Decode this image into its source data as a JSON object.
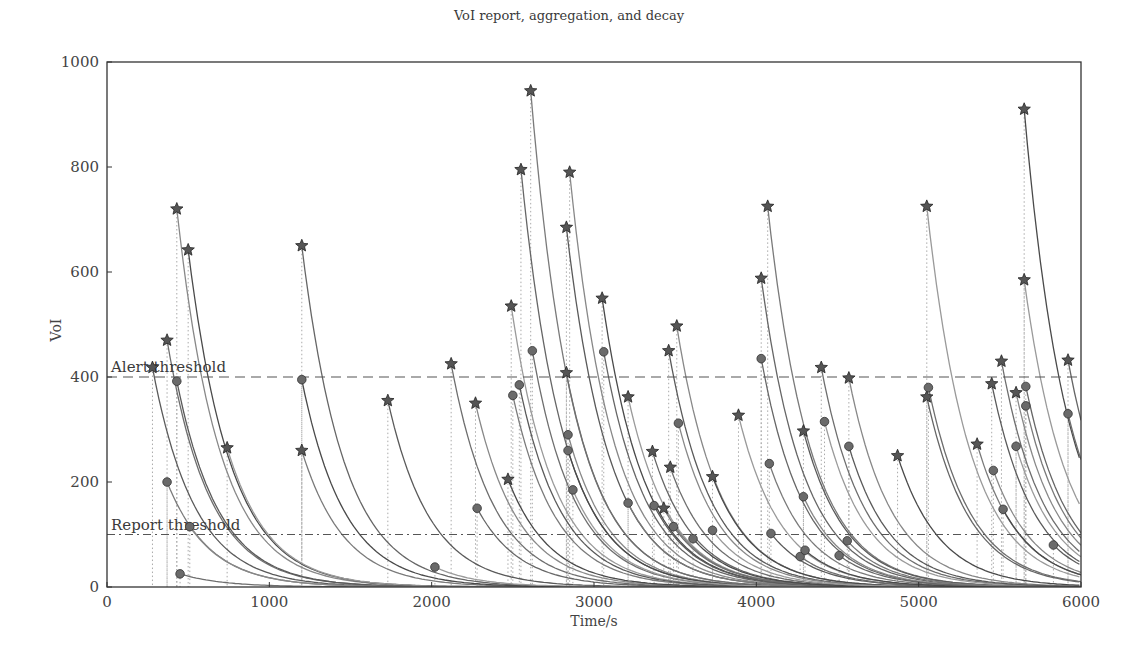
{
  "chart_data": {
    "type": "scatter",
    "title": "VoI report, aggregation, and decay",
    "xlabel": "Time/s",
    "ylabel": "VoI",
    "xlim": [
      0,
      6000
    ],
    "ylim": [
      0,
      1000
    ],
    "xticks": [
      0,
      1000,
      2000,
      3000,
      4000,
      5000,
      6000
    ],
    "yticks": [
      0,
      200,
      400,
      600,
      800,
      1000
    ],
    "grid": false,
    "thresholds": [
      {
        "name": "Alert threshold",
        "label": "Alert threshold",
        "value": 400,
        "style": "dashed"
      },
      {
        "name": "Report threshold",
        "label": "Report threshold",
        "value": 100,
        "style": "dashdot"
      }
    ],
    "decay_time_constant_s": 260,
    "series": [
      {
        "name": "Alert reports (star)",
        "marker": "star",
        "points": [
          [
            280,
            418
          ],
          [
            370,
            470
          ],
          [
            430,
            720
          ],
          [
            500,
            642
          ],
          [
            740,
            265
          ],
          [
            1200,
            650
          ],
          [
            1200,
            260
          ],
          [
            1730,
            355
          ],
          [
            2120,
            425
          ],
          [
            2270,
            350
          ],
          [
            2470,
            205
          ],
          [
            2490,
            535
          ],
          [
            2550,
            795
          ],
          [
            2610,
            945
          ],
          [
            2830,
            685
          ],
          [
            2830,
            408
          ],
          [
            2850,
            790
          ],
          [
            3050,
            550
          ],
          [
            3210,
            362
          ],
          [
            3360,
            258
          ],
          [
            3430,
            150
          ],
          [
            3460,
            450
          ],
          [
            3470,
            228
          ],
          [
            3510,
            497
          ],
          [
            3730,
            210
          ],
          [
            3890,
            327
          ],
          [
            4030,
            588
          ],
          [
            4070,
            725
          ],
          [
            4290,
            297
          ],
          [
            4400,
            418
          ],
          [
            4570,
            398
          ],
          [
            4870,
            250
          ],
          [
            5050,
            725
          ],
          [
            5050,
            362
          ],
          [
            5360,
            272
          ],
          [
            5450,
            387
          ],
          [
            5510,
            430
          ],
          [
            5600,
            370
          ],
          [
            5650,
            910
          ],
          [
            5650,
            585
          ],
          [
            5920,
            432
          ]
        ]
      },
      {
        "name": "Aggregated reports (circle)",
        "marker": "circle",
        "points": [
          [
            370,
            200
          ],
          [
            430,
            392
          ],
          [
            450,
            25
          ],
          [
            510,
            115
          ],
          [
            1200,
            395
          ],
          [
            2020,
            38
          ],
          [
            2280,
            150
          ],
          [
            2500,
            365
          ],
          [
            2540,
            385
          ],
          [
            2620,
            450
          ],
          [
            2840,
            290
          ],
          [
            2840,
            260
          ],
          [
            2870,
            185
          ],
          [
            3060,
            448
          ],
          [
            3210,
            160
          ],
          [
            3370,
            155
          ],
          [
            3490,
            115
          ],
          [
            3520,
            312
          ],
          [
            3610,
            92
          ],
          [
            3730,
            108
          ],
          [
            4030,
            435
          ],
          [
            4080,
            235
          ],
          [
            4090,
            102
          ],
          [
            4270,
            58
          ],
          [
            4290,
            172
          ],
          [
            4300,
            70
          ],
          [
            4420,
            315
          ],
          [
            4510,
            60
          ],
          [
            4560,
            88
          ],
          [
            4570,
            268
          ],
          [
            5060,
            380
          ],
          [
            5460,
            222
          ],
          [
            5520,
            148
          ],
          [
            5600,
            268
          ],
          [
            5660,
            382
          ],
          [
            5660,
            345
          ],
          [
            5830,
            80
          ],
          [
            5920,
            330
          ]
        ]
      }
    ]
  }
}
